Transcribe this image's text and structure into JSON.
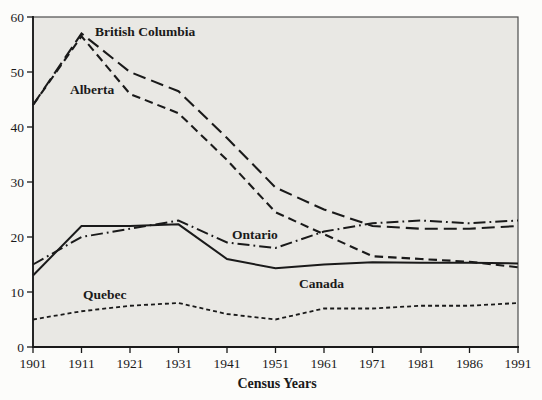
{
  "chart_data": {
    "type": "line",
    "title": "",
    "xlabel": "Census Years",
    "ylabel": "",
    "x_categories": [
      "1901",
      "1911",
      "1921",
      "1931",
      "1941",
      "1951",
      "1961",
      "1971",
      "1981",
      "1986",
      "1991"
    ],
    "yticks": [
      0,
      10,
      20,
      30,
      40,
      50,
      60
    ],
    "ylim": [
      0,
      60
    ],
    "grid": false,
    "legend_position": "inline-labels-on-plot",
    "colors": {
      "ink": "#1a1a1a",
      "plot_bg": "#e9e8e4",
      "frame": "#4d4d4d",
      "page_bg": "#fcfcfa"
    },
    "series": [
      {
        "name": "British Columbia",
        "line_style": "long-dash",
        "dash": "13,6",
        "width": 2.1,
        "values": [
          44,
          57,
          50,
          46.5,
          38,
          29,
          25,
          22,
          21.5,
          21.5,
          22
        ],
        "label_pos": {
          "x": 95,
          "y": 36
        }
      },
      {
        "name": "Alberta",
        "line_style": "medium-dash",
        "dash": "8.5,5",
        "width": 2.1,
        "values": [
          44,
          56.5,
          46,
          42.5,
          34,
          24.5,
          20.5,
          16.5,
          16,
          15.5,
          14.5
        ],
        "label_pos": {
          "x": 70,
          "y": 94
        }
      },
      {
        "name": "Ontario",
        "line_style": "dash-dot",
        "dash": "12,4,1.8,4",
        "width": 2,
        "values": [
          15,
          20,
          21.5,
          23,
          19,
          18,
          21,
          22.5,
          23,
          22.5,
          23
        ],
        "label_pos": {
          "x": 232,
          "y": 239
        }
      },
      {
        "name": "Canada",
        "line_style": "solid",
        "dash": "",
        "width": 2,
        "values": [
          13,
          22,
          22,
          22.3,
          16,
          14.3,
          15,
          15.4,
          15.3,
          15.3,
          15.2
        ],
        "label_pos": {
          "x": 299,
          "y": 288
        }
      },
      {
        "name": "Quebec",
        "line_style": "short-dash",
        "dash": "4,3",
        "width": 1.8,
        "values": [
          5,
          6.5,
          7.5,
          8,
          6,
          5,
          7,
          7,
          7.5,
          7.5,
          8
        ],
        "label_pos": {
          "x": 83,
          "y": 299
        }
      }
    ]
  }
}
